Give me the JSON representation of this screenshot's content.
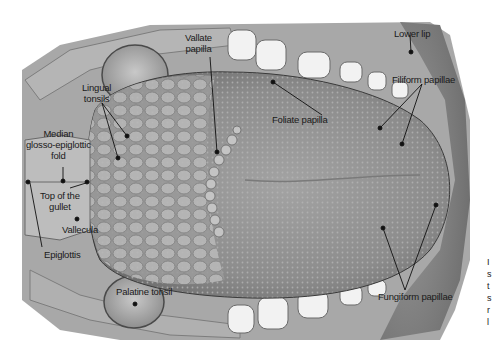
{
  "figure": {
    "background": "#ffffff",
    "illustration_tone": "#8a8a8a"
  },
  "labels": [
    {
      "id": "vallate",
      "lines": [
        "Vallate",
        "papilla"
      ]
    },
    {
      "id": "lower_lip",
      "lines": [
        "Lower lip"
      ]
    },
    {
      "id": "lingual_tonsils",
      "lines": [
        "Lingual",
        "tonsils"
      ]
    },
    {
      "id": "filiform",
      "lines": [
        "Filiform papillae"
      ]
    },
    {
      "id": "foliate",
      "lines": [
        "Foliate papilla"
      ]
    },
    {
      "id": "median_fold",
      "lines": [
        "Median",
        "glosso-epiglottic",
        "fold"
      ]
    },
    {
      "id": "top_gullet",
      "lines": [
        "Top of the",
        "gullet"
      ]
    },
    {
      "id": "vallecula",
      "lines": [
        "Vallecula"
      ]
    },
    {
      "id": "epiglottis",
      "lines": [
        "Epiglottis"
      ]
    },
    {
      "id": "palatine_tonsil",
      "lines": [
        "Palatine tonsil"
      ]
    },
    {
      "id": "fungiform",
      "lines": [
        "Fungiform papillae"
      ]
    }
  ],
  "side_text_fragments": [
    "I",
    "s",
    "t",
    "s",
    "r",
    "l"
  ]
}
